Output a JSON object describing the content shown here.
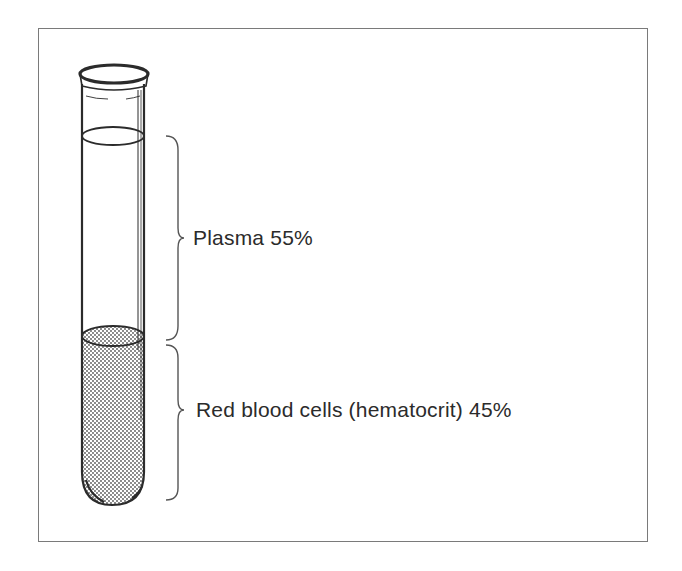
{
  "diagram": {
    "components": [
      {
        "name": "Plasma",
        "percent": 55,
        "label": "Plasma 55%"
      },
      {
        "name": "Red blood cells (hematocrit)",
        "percent": 45,
        "label": "Red blood cells  (hematocrit) 45%"
      }
    ],
    "colors": {
      "line": "#2b2b2b",
      "frame": "#7a7a7a",
      "stipple": "#555555"
    }
  }
}
